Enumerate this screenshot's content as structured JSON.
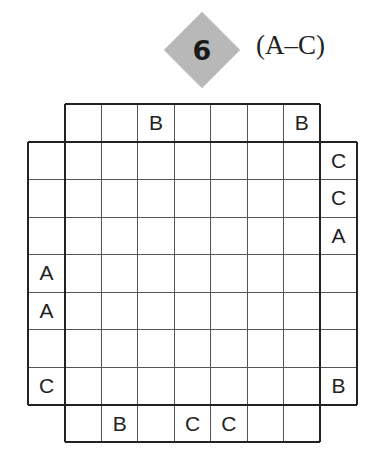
{
  "puzzle": {
    "number": "6",
    "letter_range": "(A–C)",
    "grid_size": 7,
    "badge_color": "#b8b8b8",
    "clues": {
      "top": [
        "",
        "",
        "B",
        "",
        "",
        "",
        "B"
      ],
      "bottom": [
        "",
        "B",
        "",
        "C",
        "C",
        "",
        ""
      ],
      "left": [
        "",
        "",
        "",
        "A",
        "A",
        "",
        "C"
      ],
      "right": [
        "C",
        "C",
        "A",
        "",
        "",
        "",
        "B"
      ]
    },
    "cells": [
      [
        "",
        "",
        "",
        "",
        "",
        "",
        ""
      ],
      [
        "",
        "",
        "",
        "",
        "",
        "",
        ""
      ],
      [
        "",
        "",
        "",
        "",
        "",
        "",
        ""
      ],
      [
        "",
        "",
        "",
        "",
        "",
        "",
        ""
      ],
      [
        "",
        "",
        "",
        "",
        "",
        "",
        ""
      ],
      [
        "",
        "",
        "",
        "",
        "",
        "",
        ""
      ],
      [
        "",
        "",
        "",
        "",
        "",
        "",
        ""
      ]
    ]
  }
}
